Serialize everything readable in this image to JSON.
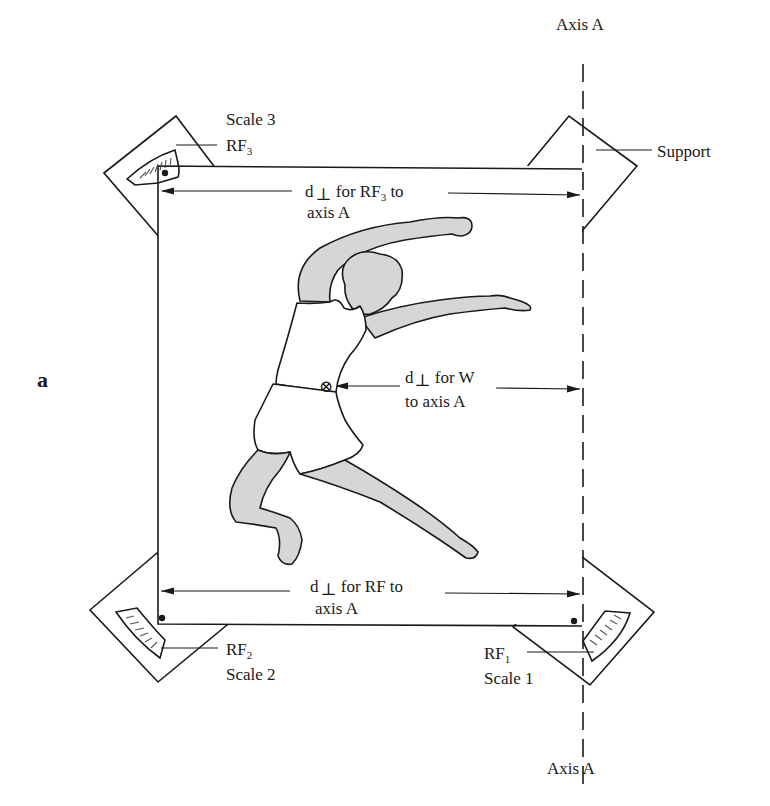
{
  "figure": {
    "panel_label": "a",
    "axis": {
      "top_label": "Axis A",
      "bottom_label": "Axis A"
    },
    "support_label": "Support",
    "scales": [
      {
        "id": "scale-1",
        "name": "Scale 1",
        "force": "RF",
        "force_sub": "1"
      },
      {
        "id": "scale-2",
        "name": "Scale 2",
        "force": "RF",
        "force_sub": "2"
      },
      {
        "id": "scale-3",
        "name": "Scale 3",
        "force": "RF",
        "force_sub": "3"
      }
    ],
    "dimensions": {
      "top": {
        "line1_pre": "d",
        "perp": "⊥",
        "line1_mid": " for RF",
        "line1_sub": "3",
        "line1_post": " to",
        "line2": "axis A"
      },
      "middle": {
        "line1_pre": "d",
        "perp": "⊥",
        "line1_post": " for W",
        "line2": "to axis A"
      },
      "bottom": {
        "line1_pre": "d",
        "perp": "⊥",
        "line1_post": " for RF to",
        "line2": "axis A"
      }
    },
    "center_of_gravity_symbol": "⊗",
    "colors": {
      "ink": "#1a1a1a",
      "skin_shading": "#d6d6d6",
      "background": "#ffffff"
    }
  }
}
